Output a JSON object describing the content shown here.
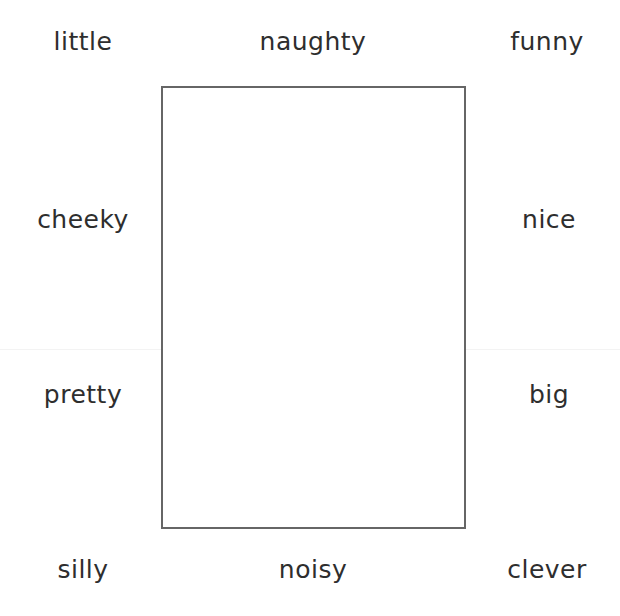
{
  "worksheet": {
    "words": {
      "top_left": "little",
      "top_center": "naughty",
      "top_right": "funny",
      "mid_upper_left": "cheeky",
      "mid_upper_right": "nice",
      "mid_lower_left": "pretty",
      "mid_lower_right": "big",
      "bottom_left": "silly",
      "bottom_center": "noisy",
      "bottom_right": "clever"
    },
    "drawing_box": {
      "border_color": "#666666",
      "content": ""
    },
    "text_color": "#2e2e2e"
  }
}
